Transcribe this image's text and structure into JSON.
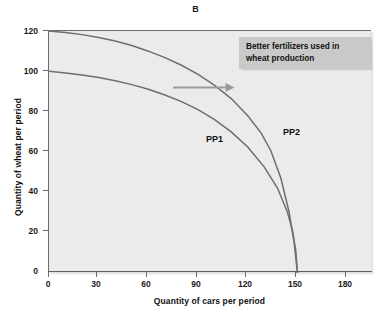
{
  "chart_data": {
    "type": "line",
    "title": "B",
    "xlabel": "Quantity of cars per period",
    "ylabel": "Quantity of wheat per period",
    "xlim": [
      0,
      195
    ],
    "ylim": [
      0,
      120
    ],
    "xticks": [
      0,
      30,
      60,
      90,
      120,
      150,
      180
    ],
    "xtick_labels": [
      "0",
      "30",
      "60",
      "90",
      "120",
      "150",
      "180"
    ],
    "yticks": [
      0,
      20,
      40,
      60,
      80,
      100,
      120
    ],
    "ytick_labels": [
      "0",
      "20",
      "40",
      "60",
      "80",
      "100",
      "120"
    ],
    "grid": false,
    "legend": "none",
    "plot_background": "#ebebeb",
    "curve_color": "#6e6e6e",
    "series": [
      {
        "name": "PP1",
        "label": "PP1",
        "description": "Original production possibilities curve, concave to origin, wheat intercept 100, cars intercept 150",
        "x": [
          0,
          10,
          20,
          30,
          40,
          50,
          60,
          70,
          80,
          90,
          100,
          110,
          120,
          130,
          138,
          144,
          147,
          149,
          150
        ],
        "y": [
          100,
          99.2,
          98.2,
          96.9,
          95.3,
          93.4,
          91.1,
          88.3,
          85.0,
          81.0,
          76.0,
          70.0,
          62.5,
          52.5,
          42.0,
          30.0,
          21.0,
          11.0,
          0
        ]
      },
      {
        "name": "PP2",
        "label": "PP2",
        "description": "Shifted-outward production possibilities curve after better fertilizers, wheat intercept 120, cars intercept 150",
        "x": [
          0,
          10,
          20,
          30,
          40,
          50,
          60,
          70,
          80,
          90,
          100,
          110,
          120,
          128,
          134,
          140,
          145,
          148,
          150
        ],
        "y": [
          120,
          119.2,
          118.2,
          116.8,
          115.0,
          112.8,
          110.0,
          106.8,
          103.0,
          98.5,
          93.0,
          86.5,
          78.0,
          69.5,
          60.5,
          47.0,
          30.0,
          15.0,
          0
        ]
      }
    ],
    "annotations": [
      {
        "name": "callout-box",
        "text": "Better fertilizers used in wheat production",
        "line1": "Better fertilizers used in",
        "line2": "wheat production",
        "background": "#c9c9c9"
      },
      {
        "name": "shift-arrow",
        "icon": "arrow-right-icon",
        "color": "#9a9a9a",
        "from_x": 75,
        "to_x": 112,
        "y": 92,
        "meaning": "Curve shifts outward from PP1 to PP2"
      }
    ]
  }
}
